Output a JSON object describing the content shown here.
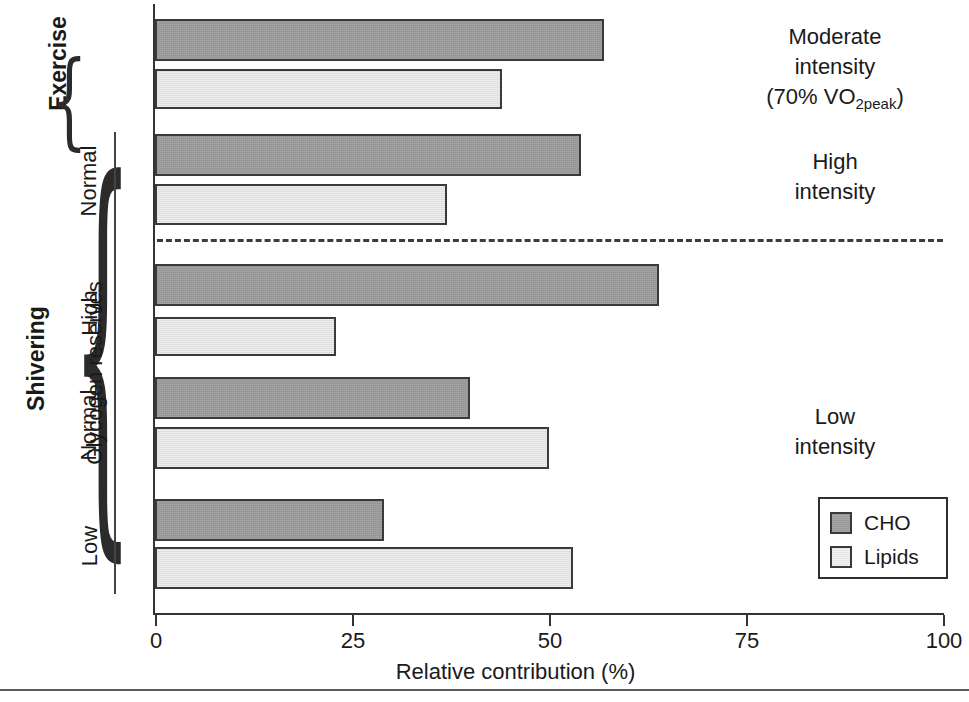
{
  "chart_data": {
    "type": "bar",
    "orientation": "horizontal",
    "title": "",
    "xlabel": "Relative contribution (%)",
    "ylabel": "",
    "xlim": [
      0,
      100
    ],
    "xticks": [
      0,
      25,
      50,
      75,
      100
    ],
    "xtick_labels": [
      "0",
      "25",
      "50",
      "75",
      "100"
    ],
    "grid": false,
    "legend_position": "bottom-right",
    "legend": [
      "CHO",
      "Lipids"
    ],
    "series": [
      {
        "name": "CHO",
        "color": "#9a9a9a",
        "values": [
          57,
          54,
          64,
          40,
          29
        ]
      },
      {
        "name": "Lipids",
        "color": "#e2e2e2",
        "values": [
          44,
          37,
          23,
          50,
          53
        ]
      }
    ],
    "categories": [
      "Exercise / Normal (Moderate intensity, 70% VO2peak)",
      "Shivering / Normal (High intensity)",
      "Shivering / High glycogen (Low intensity)",
      "Shivering / Normal glycogen (Low intensity)",
      "Shivering / Low glycogen (Low intensity)"
    ],
    "annotations": [
      "Moderate intensity (70% VO2peak)",
      "High intensity",
      "Low intensity"
    ]
  },
  "axis": {
    "x_title": "Relative contribution (%)",
    "ticks": [
      {
        "value": "0",
        "pos": 0
      },
      {
        "value": "25",
        "pos": 25
      },
      {
        "value": "50",
        "pos": 50
      },
      {
        "value": "75",
        "pos": 75
      },
      {
        "value": "100",
        "pos": 100
      }
    ]
  },
  "groups": {
    "exercise_label": "Exercise",
    "shivering_label": "Shivering",
    "glycogen_label": "Glycogen reserves",
    "row_labels": {
      "exercise_normal": "",
      "shivering_normal_high": "Normal",
      "glycogen_high": "High",
      "glycogen_normal": "Normal",
      "glycogen_low": "Low"
    }
  },
  "side_notes": {
    "moderate_line1": "Moderate",
    "moderate_line2": "intensity",
    "moderate_line3_pre": "(70% VO",
    "moderate_line3_sub": "2peak",
    "moderate_line3_post": ")",
    "high_line1": "High",
    "high_line2": "intensity",
    "low_line1": "Low",
    "low_line2": "intensity"
  },
  "legend": {
    "cho_label": "CHO",
    "lipids_label": "Lipids"
  },
  "bars": [
    {
      "name": "exercise-moderate-cho",
      "series": "CHO",
      "value": 57,
      "top": 19,
      "height": 42
    },
    {
      "name": "exercise-moderate-lipids",
      "series": "Lipids",
      "value": 44,
      "top": 69,
      "height": 40
    },
    {
      "name": "shivering-high-cho",
      "series": "CHO",
      "value": 54,
      "top": 134,
      "height": 42
    },
    {
      "name": "shivering-high-lipids",
      "series": "Lipids",
      "value": 37,
      "top": 184,
      "height": 41
    },
    {
      "name": "glycogen-high-cho",
      "series": "CHO",
      "value": 64,
      "top": 264,
      "height": 42
    },
    {
      "name": "glycogen-high-lipids",
      "series": "Lipids",
      "value": 23,
      "top": 317,
      "height": 39
    },
    {
      "name": "glycogen-normal-cho",
      "series": "CHO",
      "value": 40,
      "top": 377,
      "height": 42
    },
    {
      "name": "glycogen-normal-lipids",
      "series": "Lipids",
      "value": 50,
      "top": 427,
      "height": 42
    },
    {
      "name": "glycogen-low-cho",
      "series": "CHO",
      "value": 29,
      "top": 499,
      "height": 42
    },
    {
      "name": "glycogen-low-lipids",
      "series": "Lipids",
      "value": 53,
      "top": 547,
      "height": 42
    }
  ]
}
